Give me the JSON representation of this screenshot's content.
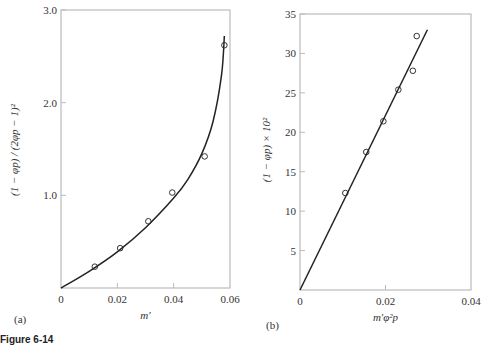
{
  "figure_caption": "Figure 6-14",
  "chart_data": [
    {
      "panel": "(a)",
      "type": "scatter",
      "title": "",
      "xlabel": "m′",
      "ylabel": "(1 − φp) / (2φp − 1)²",
      "xlim": [
        0,
        0.06
      ],
      "ylim": [
        0,
        3.0
      ],
      "x_ticks": [
        "0",
        "0.02",
        "0.04",
        "0.06"
      ],
      "y_ticks": [
        "1.0",
        "2.0",
        "3.0"
      ],
      "grid": false,
      "series": [
        {
          "name": "data",
          "marker": "open-circle",
          "x": [
            0.012,
            0.021,
            0.031,
            0.0395,
            0.051,
            0.058
          ],
          "y": [
            0.23,
            0.43,
            0.72,
            1.03,
            1.42,
            2.62
          ]
        },
        {
          "name": "fit curve",
          "style": "line",
          "x": [
            0,
            0.01,
            0.02,
            0.03,
            0.04,
            0.045,
            0.05,
            0.054,
            0.057,
            0.058
          ],
          "y": [
            0,
            0.18,
            0.39,
            0.65,
            0.97,
            1.17,
            1.45,
            1.8,
            2.3,
            2.72
          ]
        }
      ]
    },
    {
      "panel": "(b)",
      "type": "scatter",
      "title": "",
      "xlabel": "m′φ²p",
      "ylabel": "(1 − φp) × 10²",
      "xlim": [
        0,
        0.04
      ],
      "ylim": [
        0,
        35
      ],
      "x_ticks": [
        "0",
        "0.02",
        "0.04"
      ],
      "y_ticks": [
        "5",
        "10",
        "15",
        "20",
        "25",
        "30",
        "35"
      ],
      "grid": false,
      "series": [
        {
          "name": "data",
          "marker": "open-circle",
          "x": [
            0.0106,
            0.0155,
            0.0195,
            0.023,
            0.0264,
            0.0273
          ],
          "y": [
            12.3,
            17.5,
            21.4,
            25.4,
            27.8,
            32.2
          ]
        },
        {
          "name": "fit line",
          "style": "line",
          "x": [
            0,
            0.0298
          ],
          "y": [
            0,
            33.0
          ]
        }
      ]
    }
  ]
}
